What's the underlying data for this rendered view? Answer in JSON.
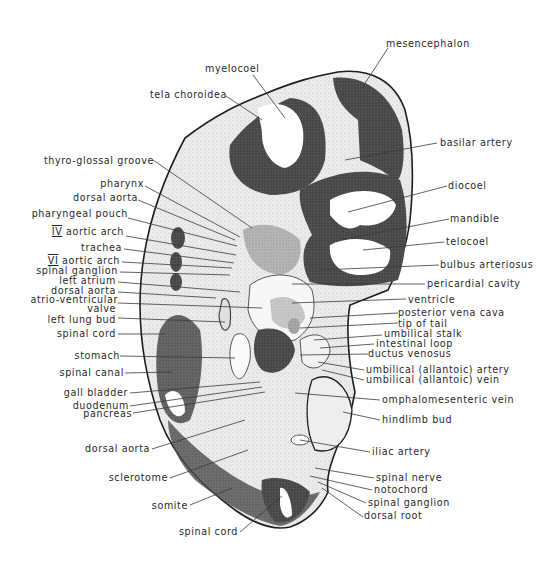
{
  "figure": {
    "type": "embryo-section-diagram",
    "colors": {
      "background": "#ffffff",
      "outline": "#1e1e1e",
      "mesenchyme": "#e6e6e6",
      "neural_tissue": "#4a4a4a",
      "label_text": "#2a2a2a",
      "leader_line": "#3a3a3a"
    }
  },
  "labels": {
    "top": [
      {
        "id": "mesencephalon",
        "text": "mesencephalon"
      },
      {
        "id": "myelocoel",
        "text": "myelocoel"
      },
      {
        "id": "tela_choroidea",
        "text": "tela choroidea"
      }
    ],
    "left": [
      {
        "id": "thyro_glossal_groove",
        "text": "thyro-glossal groove"
      },
      {
        "id": "pharynx",
        "text": "pharynx"
      },
      {
        "id": "dorsal_aorta_1",
        "text": "dorsal aorta"
      },
      {
        "id": "pharyngeal_pouch",
        "text": "pharyngeal pouch"
      },
      {
        "id": "iv_aortic_arch",
        "roman": "IV",
        "text": "aortic arch"
      },
      {
        "id": "trachea",
        "text": "trachea"
      },
      {
        "id": "vi_aortic_arch",
        "roman": "VI",
        "text": "aortic arch"
      },
      {
        "id": "spinal_ganglion_1",
        "text": "spinal ganglion"
      },
      {
        "id": "left_atrium",
        "text": "left atrium"
      },
      {
        "id": "dorsal_aorta_2",
        "text": "dorsal aorta"
      },
      {
        "id": "atrio_ventricular_valve_1",
        "text": "atrio-ventricular"
      },
      {
        "id": "atrio_ventricular_valve_2",
        "text": "valve"
      },
      {
        "id": "left_lung_bud",
        "text": "left lung bud"
      },
      {
        "id": "spinal_cord_1",
        "text": "spinal cord"
      },
      {
        "id": "stomach",
        "text": "stomach"
      },
      {
        "id": "spinal_canal",
        "text": "spinal canal"
      },
      {
        "id": "gall_bladder",
        "text": "gall bladder"
      },
      {
        "id": "duodenum",
        "text": "duodenum"
      },
      {
        "id": "pancreas",
        "text": "pancreas"
      },
      {
        "id": "dorsal_aorta_3",
        "text": "dorsal aorta"
      },
      {
        "id": "sclerotome",
        "text": "sclerotome"
      },
      {
        "id": "somite",
        "text": "somite"
      },
      {
        "id": "spinal_cord_2",
        "text": "spinal cord"
      }
    ],
    "right": [
      {
        "id": "basilar_artery",
        "text": "basilar artery"
      },
      {
        "id": "diocoel",
        "text": "diocoel"
      },
      {
        "id": "mandible",
        "text": "mandible"
      },
      {
        "id": "telocoel",
        "text": "telocoel"
      },
      {
        "id": "bulbus_arteriosus",
        "text": "bulbus arteriosus"
      },
      {
        "id": "pericardial_cavity",
        "text": "pericardial cavity"
      },
      {
        "id": "ventricle",
        "text": "ventricle"
      },
      {
        "id": "posterior_vena_cava",
        "text": "posterior vena cava"
      },
      {
        "id": "tip_of_tail",
        "text": "tip of tail"
      },
      {
        "id": "umbilical_stalk",
        "text": "umbilical stalk"
      },
      {
        "id": "intestinal_loop",
        "text": "intestinal loop"
      },
      {
        "id": "ductus_venosus",
        "text": "ductus venosus"
      },
      {
        "id": "umbilical_artery",
        "text": "umbilical (allantoic) artery"
      },
      {
        "id": "umbilical_vein",
        "text": "umbilical (allantoic) vein"
      },
      {
        "id": "omphalomesenteric_vein",
        "text": "omphalomesenteric vein"
      },
      {
        "id": "hindlimb_bud",
        "text": "hindlimb bud"
      },
      {
        "id": "iliac_artery",
        "text": "iliac artery"
      },
      {
        "id": "spinal_nerve",
        "text": "spinal nerve"
      },
      {
        "id": "notochord",
        "text": "notochord"
      },
      {
        "id": "spinal_ganglion_2",
        "text": "spinal ganglion"
      },
      {
        "id": "dorsal_root",
        "text": "dorsal root"
      }
    ]
  }
}
